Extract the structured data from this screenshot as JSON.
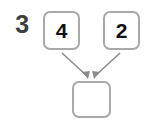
{
  "worksheet": {
    "question_number": "3",
    "background_color": "#ffffff",
    "box_border_color": "#a9a9a9",
    "arrow_color": "#8c8c8c",
    "digit_color": "#111111",
    "number_color": "#3f3f3f"
  },
  "diagram": {
    "type": "number-bond-addition",
    "addends": [
      {
        "label": "4",
        "name": "first-addend"
      },
      {
        "label": "2",
        "name": "second-addend"
      }
    ],
    "result": {
      "label": "",
      "name": "sum-answer",
      "empty": true
    },
    "arrows": [
      {
        "name": "arrow-from-first-addend",
        "from": "first-addend",
        "to": "sum-answer"
      },
      {
        "name": "arrow-from-second-addend",
        "from": "second-addend",
        "to": "sum-answer"
      }
    ]
  }
}
